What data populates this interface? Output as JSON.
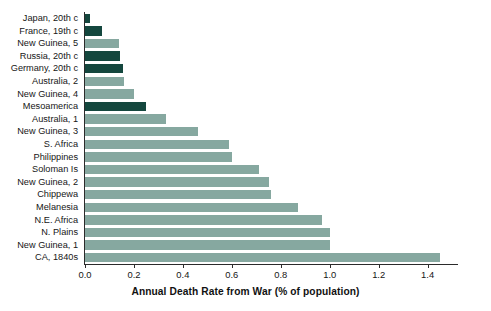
{
  "chart_data": {
    "type": "bar",
    "orientation": "horizontal",
    "title": "",
    "xlabel": "Annual Death Rate from War (% of population)",
    "ylabel": "",
    "xlim": [
      0.0,
      1.52
    ],
    "xticks": [
      0.0,
      0.2,
      0.4,
      0.6,
      0.8,
      1.0,
      1.2,
      1.4
    ],
    "xtick_labels": [
      "0.0",
      "0.2",
      "0.4",
      "0.6",
      "0.8",
      "1.0",
      "1.2",
      "1.4"
    ],
    "grid": false,
    "legend": false,
    "categories": [
      "Japan, 20th c",
      "France, 19th c",
      "New Guinea, 5",
      "Russia, 20th c",
      "Germany, 20th c",
      "Australia, 2",
      "New Guinea, 4",
      "Mesoamerica",
      "Australia, 1",
      "New Guinea, 3",
      "S. Africa",
      "Philippines",
      "Soloman Is",
      "New Guinea, 2",
      "Chippewa",
      "Melanesia",
      "N.E. Africa",
      "N. Plains",
      "New Guinea, 1",
      "CA, 1840s"
    ],
    "values": [
      0.02,
      0.07,
      0.14,
      0.145,
      0.155,
      0.16,
      0.2,
      0.25,
      0.33,
      0.46,
      0.59,
      0.6,
      0.71,
      0.75,
      0.76,
      0.87,
      0.97,
      1.0,
      1.0,
      1.45
    ],
    "highlight": [
      true,
      true,
      false,
      true,
      true,
      false,
      false,
      true,
      false,
      false,
      false,
      false,
      false,
      false,
      false,
      false,
      false,
      false,
      false,
      false
    ],
    "colors": {
      "bar_default": "#86a8a0",
      "bar_highlight": "#14473e",
      "axis": "#2b2b2b",
      "text": "#161616",
      "background": "#ffffff"
    }
  }
}
